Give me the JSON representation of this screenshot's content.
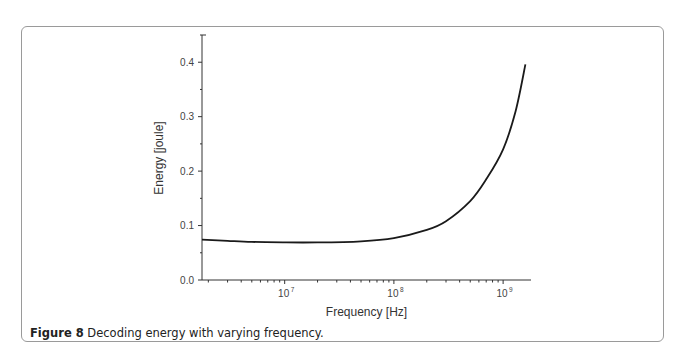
{
  "figure": {
    "label": "Figure 8",
    "caption": "Decoding energy with varying frequency."
  },
  "chart_data": {
    "type": "line",
    "title": "",
    "xlabel": "Frequency [Hz]",
    "ylabel": "Energy [joule]",
    "xscale": "log",
    "xlim": [
      1750000.0,
      1800000000.0
    ],
    "ylim": [
      0.0,
      0.45
    ],
    "xticks": [
      {
        "value": 10000000.0,
        "label_base": "10",
        "label_exp": "7"
      },
      {
        "value": 100000000.0,
        "label_base": "10",
        "label_exp": "8"
      },
      {
        "value": 1000000000.0,
        "label_base": "10",
        "label_exp": "9"
      }
    ],
    "yticks": [
      {
        "value": 0.0,
        "label": "0.0"
      },
      {
        "value": 0.1,
        "label": "0.1"
      },
      {
        "value": 0.2,
        "label": "0.2"
      },
      {
        "value": 0.3,
        "label": "0.3"
      },
      {
        "value": 0.4,
        "label": "0.4"
      }
    ],
    "grid": false,
    "legend": null,
    "series": [
      {
        "name": "Decoding energy",
        "color": "#1a1a1a",
        "x": [
          1750000.0,
          3000000.0,
          5000000.0,
          10000000.0,
          20000000.0,
          50000000.0,
          100000000.0,
          200000000.0,
          300000000.0,
          500000000.0,
          700000000.0,
          1000000000.0,
          1300000000.0,
          1600000000.0
        ],
        "y": [
          0.074,
          0.072,
          0.07,
          0.069,
          0.069,
          0.071,
          0.077,
          0.092,
          0.108,
          0.145,
          0.185,
          0.24,
          0.31,
          0.396
        ]
      }
    ]
  }
}
